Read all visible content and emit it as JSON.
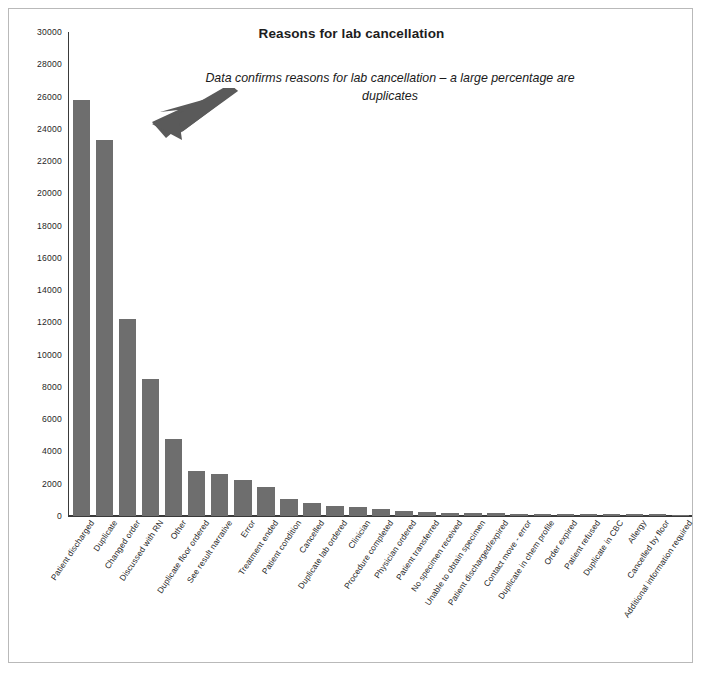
{
  "chart_data": {
    "type": "bar",
    "title": "Reasons for lab cancellation",
    "xlabel": "",
    "ylabel": "",
    "ylim": [
      0,
      30000
    ],
    "ytick_step": 2000,
    "grid": false,
    "legend": false,
    "bar_color": "#6e6e6e",
    "annotations": [
      {
        "text": "Data confirms reasons for lab cancellation – a large percentage are duplicates",
        "style": "italic",
        "arrow": "arrow-pointing-down-left-to-second-bar"
      }
    ],
    "yticks": [
      "0",
      "2000",
      "4000",
      "6000",
      "8000",
      "10000",
      "12000",
      "14000",
      "16000",
      "18000",
      "20000",
      "22000",
      "24000",
      "26000",
      "28000",
      "30000"
    ],
    "categories": [
      "Patient discharged",
      "Duplicate",
      "Changed order",
      "Discussed with RN",
      "Other",
      "Duplicate floor ordered",
      "See result narrative",
      "Error",
      "Treatment ended",
      "Patient condition",
      "Cancelled",
      "Duplicate lab ordered",
      "Clinician",
      "Procedure completed",
      "Physician ordered",
      "Patient transferred",
      "No specimen received",
      "Unable to obtain specimen",
      "Patient discharged/expired",
      "Contact move - error",
      "Duplicate in chem profile",
      "Order expired",
      "Patient refused",
      "Duplicate in CBC",
      "Allergy",
      "Cancelled by floor",
      "Additional information required"
    ],
    "values": [
      25800,
      23300,
      12200,
      8500,
      4750,
      2800,
      2600,
      2250,
      1800,
      1050,
      800,
      650,
      550,
      420,
      300,
      250,
      200,
      180,
      160,
      150,
      140,
      130,
      120,
      110,
      100,
      95,
      90
    ]
  }
}
